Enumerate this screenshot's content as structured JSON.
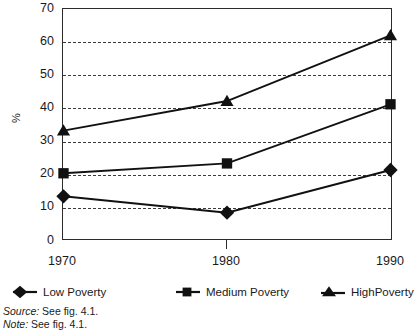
{
  "chart_data": {
    "type": "line",
    "title": "",
    "xlabel": "",
    "ylabel": "%",
    "categories": [
      "1970",
      "1980",
      "1990"
    ],
    "x": [
      1970,
      1980,
      1990
    ],
    "xlim": [
      1970,
      1990
    ],
    "ylim": [
      0,
      70
    ],
    "ytick_step": 10,
    "yticks": [
      70,
      60,
      50,
      40,
      30,
      20,
      10,
      0
    ],
    "grid": "horizontal-dashed",
    "legend_position": "bottom",
    "series": [
      {
        "name": "Low Poverty",
        "marker": "diamond",
        "values": [
          13,
          8,
          21
        ]
      },
      {
        "name": "Medium Poverty",
        "marker": "square",
        "values": [
          20,
          23,
          41
        ]
      },
      {
        "name": "HighPoverty",
        "marker": "triangle",
        "values": [
          33,
          42,
          62
        ]
      }
    ]
  },
  "axis": {
    "y_title": "%",
    "y_tick_labels": [
      "70",
      "60",
      "50",
      "40",
      "30",
      "20",
      "10",
      "0"
    ],
    "x_tick_labels": [
      "1970",
      "1980",
      "1990"
    ]
  },
  "legend": {
    "items": [
      {
        "label": "Low Poverty",
        "marker": "diamond-marker-icon"
      },
      {
        "label": "Medium Poverty",
        "marker": "square-marker-icon"
      },
      {
        "label": "HighPoverty",
        "marker": "triangle-marker-icon"
      }
    ]
  },
  "footnotes": {
    "source_keyword": "Source:",
    "source_text": " See fig. 4.1.",
    "note_keyword": "Note:",
    "note_text": " See fig. 4.1."
  },
  "colors": {
    "ink": "#1a1a1a",
    "frame": "#2b2b2b",
    "grid": "#3a3a3a",
    "series": "#111111",
    "background": "#ffffff"
  }
}
